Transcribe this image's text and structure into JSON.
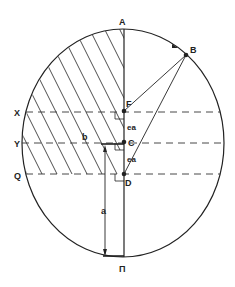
{
  "diagram": {
    "type": "orbit-ellipse-geometry",
    "colors": {
      "ink": "#222222",
      "background": "#ffffff"
    },
    "points": {
      "A": {
        "label": "A"
      },
      "B": {
        "label": "B"
      },
      "F": {
        "label": "F"
      },
      "C": {
        "label": "C"
      },
      "D": {
        "label": "D"
      },
      "X": {
        "label": "X"
      },
      "Y": {
        "label": "Y"
      },
      "Q": {
        "label": "Q"
      },
      "Pi": {
        "label": "Π"
      }
    },
    "segments": {
      "FC": {
        "label": "ea"
      },
      "CD": {
        "label": "ea"
      },
      "semi_minor": {
        "label": "b"
      },
      "semi_major": {
        "label": "a"
      }
    },
    "hatched_region": "left side between X line and A, plus strip Y to Q",
    "dashed_lines": [
      "X",
      "Y",
      "Q"
    ]
  }
}
